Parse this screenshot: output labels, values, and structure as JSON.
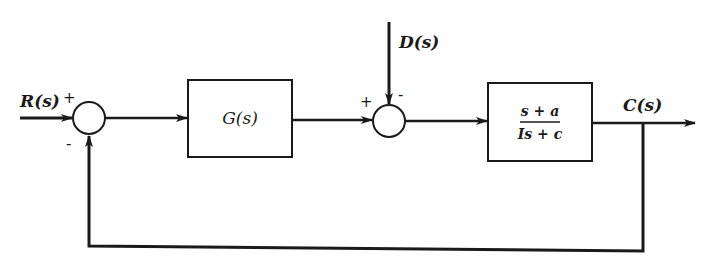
{
  "diagram": {
    "type": "block-diagram",
    "colors": {
      "line": "#1a1a1a",
      "background": "#ffffff"
    },
    "signals": {
      "input": "R(s)",
      "disturbance": "D(s)",
      "output": "C(s)"
    },
    "blocks": {
      "controller": {
        "label": "G(s)"
      },
      "plant": {
        "numerator": "s + a",
        "denominator": "Is + c"
      }
    },
    "junctions": {
      "sum1": {
        "plus_sign": "+",
        "minus_sign": "-"
      },
      "sum2": {
        "plus_sign": "+",
        "minus_sign": "-"
      }
    }
  }
}
